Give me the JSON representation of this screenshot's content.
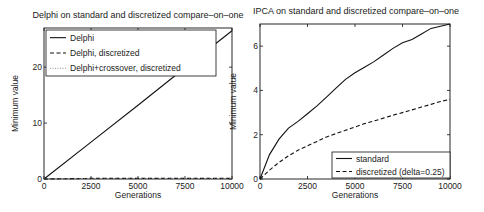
{
  "chart_data": [
    {
      "type": "line",
      "title": "Delphi on standard and discretized compare–on–one",
      "xlabel": "Generations",
      "ylabel": "Minimum value",
      "xlim": [
        0,
        10000
      ],
      "ylim": [
        0,
        27
      ],
      "xticks": [
        0,
        2500,
        5000,
        7500,
        10000
      ],
      "yticks": [
        0,
        10,
        20
      ],
      "grid": false,
      "legend_position": "upper left",
      "series": [
        {
          "name": "Delphi",
          "style": "solid",
          "x": [
            0,
            2500,
            5000,
            7500,
            10000
          ],
          "values": [
            0,
            6.6,
            13.2,
            19.9,
            26.5
          ]
        },
        {
          "name": "Delphi, discretized",
          "style": "dashed",
          "x": [
            0,
            2500,
            5000,
            7500,
            10000
          ],
          "values": [
            0,
            0.1,
            0.1,
            0.1,
            0.1
          ]
        },
        {
          "name": "Delphi+crossover, discretized",
          "style": "dotted",
          "x": [
            0,
            2500,
            5000,
            7500,
            10000
          ],
          "values": [
            0,
            0.05,
            0.05,
            0.05,
            0.05
          ]
        }
      ]
    },
    {
      "type": "line",
      "title": "IPCA on standard and discretized compare–on–one",
      "xlabel": "Generations",
      "ylabel": "Minimum value",
      "xlim": [
        0,
        10000
      ],
      "ylim": [
        0,
        7
      ],
      "xticks": [
        0,
        2500,
        5000,
        7500,
        10000
      ],
      "yticks": [
        0,
        2,
        4,
        6
      ],
      "grid": false,
      "legend_position": "lower right",
      "series": [
        {
          "name": "standard",
          "style": "solid",
          "x": [
            0,
            500,
            1000,
            1500,
            2000,
            2500,
            3000,
            3500,
            4000,
            4500,
            5000,
            5500,
            6000,
            6500,
            7000,
            7500,
            8000,
            8500,
            9000,
            9500,
            10000
          ],
          "values": [
            0,
            1.1,
            1.8,
            2.3,
            2.6,
            2.95,
            3.3,
            3.7,
            4.1,
            4.5,
            4.8,
            5.05,
            5.3,
            5.6,
            5.9,
            6.15,
            6.3,
            6.55,
            6.8,
            6.9,
            7.0
          ]
        },
        {
          "name": "discretized (delta=0.25)",
          "style": "dashed",
          "x": [
            0,
            500,
            1000,
            1500,
            2000,
            2500,
            3000,
            3500,
            4000,
            4500,
            5000,
            5500,
            6000,
            6500,
            7000,
            7500,
            8000,
            8500,
            9000,
            9500,
            10000
          ],
          "values": [
            0,
            0.4,
            0.75,
            1.05,
            1.3,
            1.5,
            1.7,
            1.9,
            2.05,
            2.2,
            2.35,
            2.5,
            2.62,
            2.75,
            2.88,
            3.0,
            3.12,
            3.25,
            3.37,
            3.5,
            3.6
          ]
        }
      ]
    }
  ]
}
